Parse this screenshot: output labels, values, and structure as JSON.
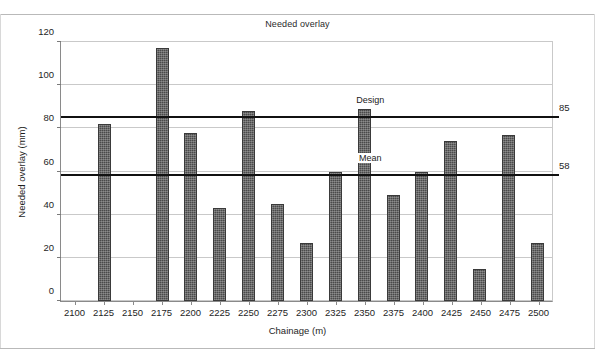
{
  "chart_data": {
    "type": "bar",
    "title": "Needed overlay",
    "xlabel": "Chainage (m)",
    "ylabel": "Needed overlay (mm)",
    "categories": [
      "2100",
      "2125",
      "2150",
      "2175",
      "2200",
      "2225",
      "2250",
      "2275",
      "2300",
      "2325",
      "2350",
      "2375",
      "2400",
      "2425",
      "2450",
      "2475",
      "2500"
    ],
    "values": [
      0,
      82,
      0,
      117,
      78,
      43,
      88,
      45,
      27,
      60,
      89,
      49,
      60,
      74,
      15,
      77,
      27
    ],
    "ylim": [
      0,
      120
    ],
    "yticks": [
      0,
      20,
      40,
      60,
      80,
      100,
      120
    ],
    "ytick_labels": [
      "0",
      "20",
      "40",
      "60",
      "80",
      "100",
      "120"
    ],
    "grid": "horizontal",
    "legend": "none",
    "bar_color": "#4a4a4a",
    "reference_lines": [
      {
        "name": "design",
        "label": "Design",
        "value": 85,
        "right_label": "85",
        "color": "#111111"
      },
      {
        "name": "mean",
        "label": "Mean",
        "value": 58,
        "right_label": "58",
        "color": "#111111"
      }
    ]
  }
}
